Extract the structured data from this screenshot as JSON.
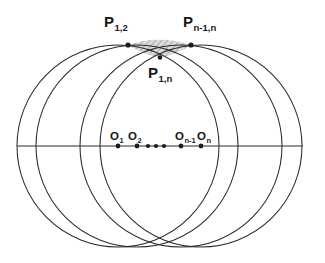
{
  "figure": {
    "background_color": "#ffffff",
    "stroke_color": "#2b2b2b",
    "lens_fill_color": "#cfcfcf",
    "width": 325,
    "height": 263,
    "labels": {
      "p12": {
        "base": "P",
        "sub": "1,2"
      },
      "pn1n": {
        "base": "P",
        "sub": "n-1,n"
      },
      "p1n": {
        "base": "P",
        "sub": "1,n"
      },
      "o1": {
        "base": "O",
        "sub": "1"
      },
      "o2": {
        "base": "O",
        "sub": "2"
      },
      "on1": {
        "base": "O",
        "sub": "n-1"
      },
      "on": {
        "base": "O",
        "sub": "n"
      }
    }
  },
  "chart_data": {
    "type": "scatter",
    "xlabel": "",
    "ylabel": "",
    "grid": false,
    "legend": null,
    "xlim": [
      0,
      325
    ],
    "ylim": [
      0,
      263
    ],
    "axis_line": {
      "y": 146,
      "x_start": 22,
      "x_end": 303
    },
    "circle_radius": 101,
    "circles": [
      {
        "name": "circle-1",
        "cx": 118,
        "cy": 146,
        "r": 101
      },
      {
        "name": "circle-2",
        "cx": 137,
        "cy": 146,
        "r": 101
      },
      {
        "name": "circle-n-1",
        "cx": 181,
        "cy": 146,
        "r": 101
      },
      {
        "name": "circle-n",
        "cx": 201,
        "cy": 146,
        "r": 101
      }
    ],
    "centers": [
      {
        "label": "O1",
        "x": 118,
        "y": 146
      },
      {
        "label": "O2",
        "x": 137,
        "y": 146
      },
      {
        "label": "ellipsis-1",
        "x": 148,
        "y": 146
      },
      {
        "label": "ellipsis-2",
        "x": 156,
        "y": 146
      },
      {
        "label": "ellipsis-3",
        "x": 164,
        "y": 146
      },
      {
        "label": "On-1",
        "x": 181,
        "y": 146
      },
      {
        "label": "On",
        "x": 201,
        "y": 146
      }
    ],
    "intersection_points": [
      {
        "label": "P1,2",
        "x": 128,
        "y": 45
      },
      {
        "label": "Pn-1,n",
        "x": 191,
        "y": 45
      },
      {
        "label": "P1,n",
        "x": 160,
        "y": 57
      }
    ],
    "shaded_region": {
      "name": "lens-of-common-intersection",
      "description": "small hatched lens bounded by the four arcs near the top",
      "x_range": [
        128,
        191
      ],
      "y_range": [
        45,
        58
      ]
    }
  }
}
